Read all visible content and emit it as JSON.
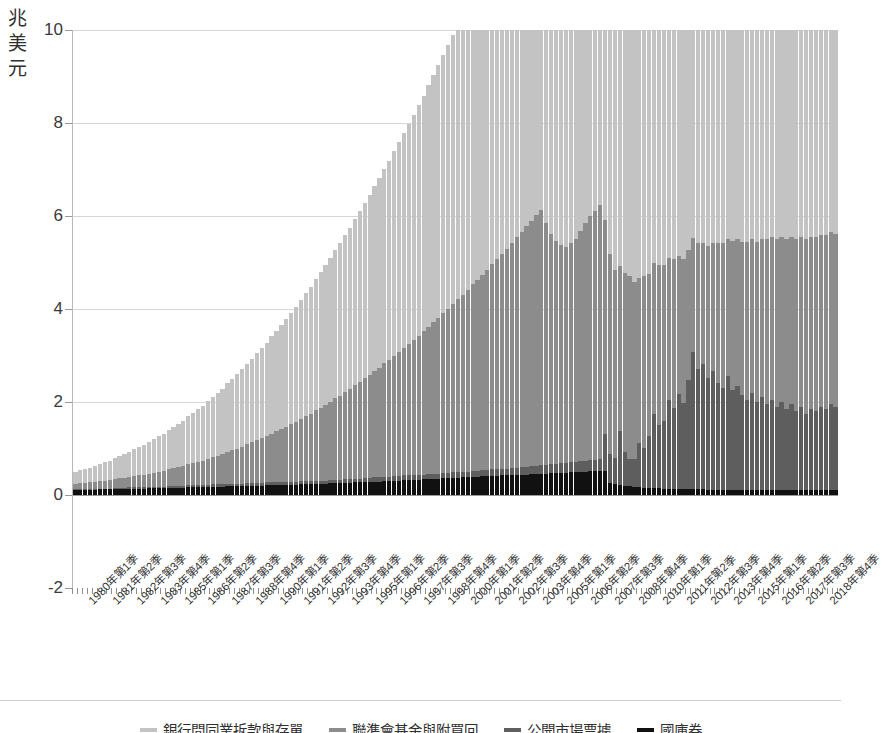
{
  "chart_data": {
    "type": "bar",
    "stacked": true,
    "title": "",
    "subtitle": "",
    "xlabel": "",
    "ylabel": "兆美元",
    "ylim": [
      -2,
      10
    ],
    "yticks": [
      -2,
      0,
      2,
      4,
      6,
      8,
      10
    ],
    "gridlines": [
      2,
      4,
      6,
      8,
      10
    ],
    "grid": true,
    "legend_position": "bottom",
    "units": "兆美元",
    "x_tick_labels": [
      "1980年第1季",
      "1981年第2季",
      "1982年第3季",
      "1983年第4季",
      "1985年第1季",
      "1986年第2季",
      "1987年第3季",
      "1988年第4季",
      "1990年第1季",
      "1991年第2季",
      "1992年第3季",
      "1993年第4季",
      "1995年第1季",
      "1996年第2季",
      "1997年第3季",
      "1998年第4季",
      "2000年第1季",
      "2001年第2季",
      "2002年第3季",
      "2003年第4季",
      "2005年第1季",
      "2006年第2季",
      "2007年第3季",
      "2008年第4季",
      "2010年第1季",
      "2011年第2季",
      "2012年第3季",
      "2013年第4季",
      "2015年第1季",
      "2016年第2季",
      "2017年第3季",
      "2018年第4季"
    ],
    "x_start": "1980年第1季",
    "x_end": "2018年第4季",
    "n_periods": 156,
    "colors": {
      "series_1": "#111111",
      "series_2": "#5e5e5e",
      "series_3": "#8c8c8c",
      "series_4": "#c3c3c3"
    },
    "series": [
      {
        "name": "國庫券",
        "color": "#111111",
        "order": 1,
        "values": [
          0.1,
          0.1,
          0.11,
          0.11,
          0.11,
          0.12,
          0.12,
          0.12,
          0.13,
          0.13,
          0.13,
          0.14,
          0.14,
          0.14,
          0.14,
          0.15,
          0.15,
          0.15,
          0.15,
          0.16,
          0.16,
          0.16,
          0.16,
          0.17,
          0.17,
          0.17,
          0.17,
          0.18,
          0.18,
          0.18,
          0.18,
          0.19,
          0.19,
          0.19,
          0.19,
          0.2,
          0.2,
          0.2,
          0.2,
          0.21,
          0.21,
          0.21,
          0.22,
          0.22,
          0.22,
          0.22,
          0.23,
          0.23,
          0.23,
          0.24,
          0.24,
          0.24,
          0.25,
          0.25,
          0.25,
          0.26,
          0.26,
          0.27,
          0.27,
          0.28,
          0.28,
          0.29,
          0.29,
          0.3,
          0.3,
          0.31,
          0.31,
          0.32,
          0.32,
          0.33,
          0.33,
          0.34,
          0.34,
          0.35,
          0.35,
          0.36,
          0.36,
          0.37,
          0.37,
          0.38,
          0.38,
          0.39,
          0.39,
          0.4,
          0.4,
          0.41,
          0.41,
          0.42,
          0.42,
          0.43,
          0.43,
          0.44,
          0.44,
          0.45,
          0.45,
          0.46,
          0.46,
          0.47,
          0.47,
          0.48,
          0.48,
          0.49,
          0.49,
          0.5,
          0.5,
          0.51,
          0.51,
          0.52,
          0.52,
          0.26,
          0.24,
          0.22,
          0.2,
          0.19,
          0.18,
          0.17,
          0.16,
          0.16,
          0.15,
          0.15,
          0.14,
          0.14,
          0.13,
          0.13,
          0.13,
          0.12,
          0.12,
          0.12,
          0.12,
          0.11,
          0.11,
          0.11,
          0.11,
          0.11,
          0.11,
          0.1,
          0.1,
          0.1,
          0.1,
          0.1,
          0.1,
          0.1,
          0.1,
          0.1,
          0.1,
          0.1,
          0.1,
          0.1,
          0.1,
          0.1,
          0.1,
          0.1,
          0.1,
          0.1,
          0.1,
          0.1
        ]
      },
      {
        "name": "聯準會基金與附買回",
        "color": "#5e5e5e",
        "order": 2,
        "values": [
          0.02,
          0.02,
          0.02,
          0.02,
          0.02,
          0.02,
          0.02,
          0.02,
          0.02,
          0.03,
          0.03,
          0.03,
          0.03,
          0.03,
          0.03,
          0.03,
          0.03,
          0.03,
          0.03,
          0.04,
          0.04,
          0.04,
          0.04,
          0.04,
          0.04,
          0.04,
          0.04,
          0.04,
          0.05,
          0.05,
          0.05,
          0.05,
          0.05,
          0.05,
          0.05,
          0.05,
          0.05,
          0.06,
          0.06,
          0.06,
          0.06,
          0.06,
          0.06,
          0.06,
          0.06,
          0.06,
          0.07,
          0.07,
          0.07,
          0.07,
          0.07,
          0.07,
          0.07,
          0.08,
          0.08,
          0.08,
          0.08,
          0.08,
          0.08,
          0.08,
          0.09,
          0.09,
          0.09,
          0.09,
          0.09,
          0.09,
          0.1,
          0.1,
          0.1,
          0.1,
          0.1,
          0.1,
          0.11,
          0.11,
          0.11,
          0.11,
          0.11,
          0.12,
          0.12,
          0.12,
          0.12,
          0.13,
          0.13,
          0.13,
          0.14,
          0.14,
          0.14,
          0.15,
          0.15,
          0.15,
          0.16,
          0.16,
          0.17,
          0.17,
          0.18,
          0.18,
          0.19,
          0.19,
          0.2,
          0.2,
          0.21,
          0.22,
          0.22,
          0.23,
          0.24,
          0.24,
          0.25,
          0.26,
          0.8,
          0.62,
          0.55,
          1.15,
          0.72,
          0.58,
          0.6,
          0.95,
          0.85,
          1.1,
          1.6,
          1.35,
          1.45,
          1.9,
          1.75,
          2.05,
          1.85,
          2.35,
          2.95,
          2.6,
          2.7,
          2.4,
          2.55,
          2.3,
          2.2,
          2.45,
          2.15,
          2.25,
          2.05,
          1.95,
          2.1,
          1.9,
          2.0,
          1.85,
          1.95,
          1.8,
          1.9,
          1.75,
          1.85,
          1.7,
          1.8,
          1.65,
          1.75,
          1.7,
          1.8,
          1.75,
          1.85,
          1.8
        ]
      },
      {
        "name": "公開市場票據",
        "color": "#8c8c8c",
        "order": 3,
        "values": [
          0.12,
          0.13,
          0.13,
          0.14,
          0.15,
          0.16,
          0.17,
          0.18,
          0.19,
          0.2,
          0.21,
          0.22,
          0.24,
          0.25,
          0.27,
          0.28,
          0.3,
          0.32,
          0.34,
          0.36,
          0.38,
          0.4,
          0.42,
          0.45,
          0.47,
          0.5,
          0.53,
          0.56,
          0.59,
          0.62,
          0.65,
          0.69,
          0.72,
          0.76,
          0.8,
          0.84,
          0.88,
          0.92,
          0.96,
          1.0,
          1.05,
          1.1,
          1.14,
          1.19,
          1.24,
          1.29,
          1.34,
          1.4,
          1.45,
          1.51,
          1.57,
          1.63,
          1.69,
          1.75,
          1.81,
          1.88,
          1.94,
          2.01,
          2.08,
          2.15,
          2.22,
          2.29,
          2.36,
          2.44,
          2.51,
          2.59,
          2.67,
          2.75,
          2.83,
          2.91,
          3.0,
          3.08,
          3.17,
          3.26,
          3.35,
          3.44,
          3.53,
          3.62,
          3.72,
          3.81,
          3.91,
          4.01,
          4.11,
          4.21,
          4.31,
          4.41,
          4.52,
          4.62,
          4.73,
          4.84,
          4.95,
          5.06,
          5.17,
          5.28,
          5.39,
          5.5,
          5.2,
          4.95,
          4.8,
          4.7,
          4.65,
          4.7,
          4.8,
          4.95,
          5.1,
          5.25,
          5.35,
          5.45,
          4.6,
          4.3,
          4.05,
          3.55,
          3.85,
          3.95,
          3.8,
          3.55,
          3.7,
          3.5,
          3.25,
          3.45,
          3.35,
          3.05,
          3.2,
          2.95,
          3.1,
          2.8,
          2.45,
          2.7,
          2.6,
          2.85,
          2.75,
          3.0,
          3.1,
          2.95,
          3.2,
          3.15,
          3.3,
          3.4,
          3.3,
          3.45,
          3.4,
          3.55,
          3.5,
          3.6,
          3.55,
          3.65,
          3.6,
          3.7,
          3.65,
          3.75,
          3.7,
          3.75,
          3.7,
          3.75,
          3.7,
          3.72
        ]
      },
      {
        "name": "銀行間同業拆款與存單",
        "color": "#c3c3c3",
        "order": 4,
        "values": [
          0.26,
          0.28,
          0.3,
          0.32,
          0.35,
          0.37,
          0.4,
          0.42,
          0.45,
          0.48,
          0.51,
          0.54,
          0.57,
          0.61,
          0.64,
          0.68,
          0.72,
          0.76,
          0.8,
          0.84,
          0.89,
          0.93,
          0.98,
          1.03,
          1.08,
          1.13,
          1.18,
          1.24,
          1.29,
          1.35,
          1.41,
          1.47,
          1.53,
          1.6,
          1.66,
          1.73,
          1.8,
          1.87,
          1.94,
          2.01,
          2.09,
          2.16,
          2.24,
          2.32,
          2.4,
          2.48,
          2.56,
          2.65,
          2.73,
          2.82,
          2.91,
          3.0,
          3.09,
          3.18,
          3.28,
          3.37,
          3.47,
          3.57,
          3.67,
          3.77,
          3.87,
          3.97,
          4.08,
          4.18,
          4.29,
          4.4,
          4.51,
          4.62,
          4.73,
          4.84,
          4.96,
          5.07,
          5.19,
          5.31,
          5.43,
          5.55,
          5.67,
          5.79,
          5.91,
          6.04,
          6.16,
          6.29,
          6.42,
          6.55,
          6.68,
          6.81,
          6.94,
          7.08,
          7.21,
          7.35,
          7.49,
          7.63,
          7.77,
          7.91,
          8.05,
          8.2,
          7.6,
          7.2,
          6.95,
          6.8,
          6.75,
          6.9,
          7.05,
          7.25,
          7.5,
          7.75,
          7.95,
          8.15,
          7.1,
          6.7,
          6.4,
          6.85,
          6.55,
          6.7,
          6.6,
          6.8,
          6.9,
          7.2,
          7.4,
          7.3,
          7.45,
          7.55,
          7.7,
          7.8,
          7.9,
          8.05,
          8.2,
          8.35,
          8.45,
          8.55,
          8.4,
          8.6,
          8.7,
          8.55,
          8.75,
          8.65,
          8.8,
          8.7,
          8.85,
          8.75,
          8.9,
          8.8,
          8.95,
          8.85,
          9.0,
          8.9,
          9.05,
          8.95,
          9.0,
          8.9,
          9.05,
          8.95,
          9.1,
          9.0,
          9.05,
          9.1
        ]
      }
    ]
  },
  "axis": {
    "y_title": "兆\n美\n元",
    "y_tick_labels": [
      "10",
      "8",
      "6",
      "4",
      "2",
      "0",
      "-2"
    ]
  },
  "legend": {
    "items": [
      {
        "label": "銀行間同業拆款與存單",
        "color": "#c3c3c3"
      },
      {
        "label": "聯準會基金與附買回",
        "color": "#8c8c8c"
      },
      {
        "label": "公開市場票據",
        "color": "#5e5e5e"
      },
      {
        "label": "國庫券",
        "color": "#111111"
      }
    ]
  }
}
